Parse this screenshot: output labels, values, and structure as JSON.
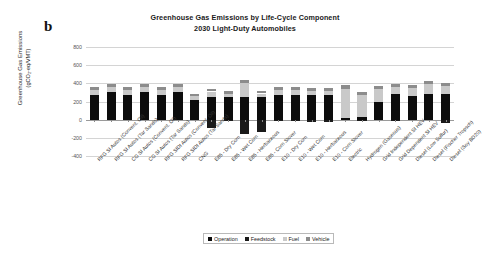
{
  "panel": {
    "letter": "b"
  },
  "titles": {
    "line1": "Greenhouse Gas Emissions by Life-Cycle Component",
    "line2": "2030 Light-Duty Automobiles"
  },
  "axes": {
    "y_title_line1": "Greenhouse Gas Emissions",
    "y_title_line2": "(gCO₂-eq/VMT)",
    "y_ticks": [
      "800",
      "600",
      "400",
      "200",
      "0",
      "-200",
      "-400"
    ],
    "x_title": ""
  },
  "legend": {
    "position": "bottom-center",
    "items": [
      {
        "label": "Operation",
        "color": "#0c0c0c",
        "icon": "square-swatch"
      },
      {
        "label": "Feedstock",
        "color": "#1a1a1a",
        "icon": "square-swatch"
      },
      {
        "label": "Fuel",
        "color": "#c9c9c9",
        "icon": "square-swatch"
      },
      {
        "label": "Vehicle",
        "color": "#8c8c8c",
        "icon": "square-swatch"
      }
    ]
  },
  "chart_data": {
    "type": "bar",
    "stacked": true,
    "xlabel": "",
    "ylabel": "Greenhouse Gas Emissions (gCO2-eq/VMT)",
    "ylim": [
      -400,
      800
    ],
    "ytick_step": 200,
    "grid": true,
    "categories": [
      "RFG SI Autos (Convent. Oil)",
      "RFG SI Autos (Tar Sands)",
      "CG SI Autos (Convent. Oil)",
      "CG SI Autos (Tar Sands)",
      "RFG SIDI Autos (Convent. Oil)",
      "RFG SIDI Autos (Tar Sands)",
      "CNG",
      "E85 - Dry Corn",
      "E85 - Wet Corn",
      "E85 - Herbaceous",
      "E85 - Corn Stover",
      "E10 - Dry Corn",
      "E10 - Wet Corn",
      "E10 - Herbaceous",
      "E10 - Corn Stover",
      "Electric",
      "Hydrogen (Gaseous)",
      "Grid Independent SI HEV",
      "Grid Dependent SI HEV",
      "Diesel (Low Sulfur)",
      "Diesel (Fischer Tropsch)",
      "Diesel (Soy BD20)"
    ],
    "series": [
      {
        "name": "Operation",
        "color": "#0c0c0c",
        "values": [
          270,
          305,
          272,
          305,
          272,
          305,
          215,
          250,
          250,
          250,
          250,
          272,
          272,
          268,
          268,
          18,
          25,
          195,
          285,
          265,
          288,
          280
        ]
      },
      {
        "name": "Feedstock",
        "color": "#1a1a1a",
        "values": [
          0,
          0,
          0,
          0,
          0,
          0,
          0,
          -95,
          -20,
          -155,
          -140,
          -20,
          -5,
          -30,
          -30,
          0,
          -8,
          0,
          -18,
          0,
          0,
          -35
        ]
      },
      {
        "name": "Fuel",
        "color": "#c9c9c9",
        "values": [
          58,
          52,
          58,
          52,
          58,
          52,
          42,
          60,
          35,
          155,
          38,
          52,
          52,
          52,
          52,
          320,
          250,
          140,
          72,
          82,
          105,
          92
        ]
      },
      {
        "name": "Vehicle",
        "color": "#8c8c8c",
        "values": [
          32,
          32,
          32,
          32,
          32,
          32,
          28,
          28,
          28,
          28,
          28,
          32,
          32,
          32,
          32,
          42,
          25,
          35,
          35,
          32,
          32,
          30
        ]
      }
    ],
    "positive_totals": [
      360,
      389,
      362,
      389,
      362,
      389,
      285,
      338,
      313,
      433,
      316,
      356,
      356,
      352,
      352,
      380,
      300,
      370,
      392,
      379,
      425,
      402
    ],
    "negative_totals": [
      0,
      0,
      0,
      0,
      0,
      0,
      0,
      -95,
      -20,
      -155,
      -140,
      -20,
      -5,
      -30,
      -30,
      0,
      -8,
      0,
      -18,
      0,
      0,
      -35
    ]
  }
}
